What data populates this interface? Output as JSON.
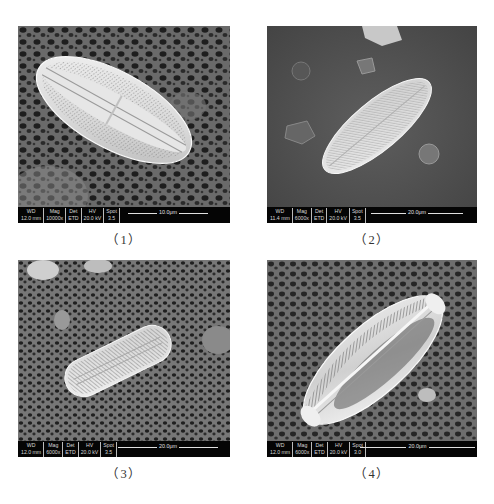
{
  "figure": {
    "panels": [
      {
        "caption": "（1）",
        "info": {
          "wd_label": "WD",
          "wd": "12.0 mm",
          "mag_label": "Mag",
          "mag": "10000x",
          "det_label": "Det",
          "det": "ETD",
          "hv_label": "HV",
          "hv": "20.0 kV",
          "spot_label": "Spot",
          "spot": "3.5"
        },
        "scale_bar": "10.0μm",
        "subject": "diatom valve, elliptical, oriented upper-left to lower-right"
      },
      {
        "caption": "（2）",
        "info": {
          "wd_label": "WD",
          "wd": "11.4 mm",
          "mag_label": "Mag",
          "mag": "6000x",
          "det_label": "Det",
          "det": "ETD",
          "hv_label": "HV",
          "hv": "20.0 kV",
          "spot_label": "Spot",
          "spot": "3.5"
        },
        "scale_bar": "20.0μm",
        "subject": "diatom valve, elongate, oriented lower-left to upper-right"
      },
      {
        "caption": "（3）",
        "info": {
          "wd_label": "WD",
          "wd": "12.0 mm",
          "mag_label": "Mag",
          "mag": "6000x",
          "det_label": "Det",
          "det": "ETD",
          "hv_label": "HV",
          "hv": "20.0 kV",
          "spot_label": "Spot",
          "spot": "3.5"
        },
        "scale_bar": "20.0μm",
        "subject": "diatom valve, oblong, oriented lower-left to upper-right"
      },
      {
        "caption": "（4）",
        "info": {
          "wd_label": "WD",
          "wd": "12.0 mm",
          "mag_label": "Mag",
          "mag": "6000x",
          "det_label": "Det",
          "det": "ETD",
          "hv_label": "HV",
          "hv": "20.0 kV",
          "spot_label": "Spot",
          "spot": "3.0"
        },
        "scale_bar": "20.0μm",
        "subject": "diatom frustule girdle view, capitate ends, oriented lower-left to upper-right"
      }
    ]
  }
}
